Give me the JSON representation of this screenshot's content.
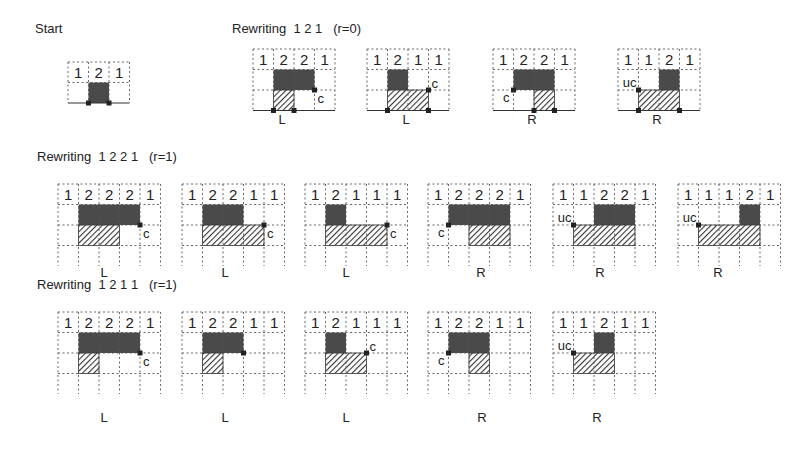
{
  "colors": {
    "solid": "#4a4a4a",
    "grid": "#555555",
    "hatch": "#333333",
    "background": "#ffffff"
  },
  "sections": [
    {
      "id": "start",
      "title": "Start",
      "title_pos": [
        35,
        35
      ]
    },
    {
      "id": "rw121",
      "title": "Rewriting  1 2 1   (r=0)",
      "title_pos": [
        232,
        35
      ]
    },
    {
      "id": "rw1221",
      "title": "Rewriting  1 2 2 1   (r=1)",
      "title_pos": [
        37,
        163
      ]
    },
    {
      "id": "rw1211",
      "title": "Rewriting  1 2 1 1   (r=1)",
      "title_pos": [
        37,
        291
      ]
    }
  ],
  "panels": [
    {
      "section": "start",
      "x": 67,
      "y": 61,
      "cell": 20.5,
      "cols": 3,
      "rows": 2,
      "heights": [
        "1",
        "2",
        "1"
      ],
      "baseline": true,
      "solid": [
        [
          1,
          1,
          1,
          1
        ]
      ],
      "hatch": [],
      "marks": [
        [
          1,
          2
        ],
        [
          2,
          2
        ]
      ],
      "annot": null,
      "label": "",
      "label_pos": null
    },
    {
      "section": "rw121",
      "x": 252,
      "y": 48,
      "cell": 20.5,
      "cols": 4,
      "rows": 3,
      "heights": [
        "1",
        "2",
        "2",
        "1"
      ],
      "baseline": true,
      "solid": [
        [
          1,
          1,
          2,
          1
        ]
      ],
      "hatch": [
        [
          1,
          2,
          1,
          1
        ]
      ],
      "marks": [
        [
          1,
          3
        ],
        [
          2,
          3
        ],
        [
          3,
          2
        ]
      ],
      "annot": {
        "text": "c",
        "at": [
          3,
          2
        ],
        "side": "br"
      },
      "label": "L",
      "label_pos": [
        282,
        120
      ]
    },
    {
      "section": "rw121",
      "x": 366,
      "y": 48,
      "cell": 20.5,
      "cols": 4,
      "rows": 3,
      "heights": [
        "1",
        "2",
        "1",
        "1"
      ],
      "baseline": true,
      "solid": [
        [
          1,
          1,
          1,
          1
        ]
      ],
      "hatch": [
        [
          1,
          2,
          2,
          1
        ]
      ],
      "marks": [
        [
          1,
          3
        ],
        [
          3,
          3
        ],
        [
          3,
          2
        ]
      ],
      "annot": {
        "text": "c",
        "at": [
          3,
          2
        ],
        "side": "tr"
      },
      "label": "L",
      "label_pos": [
        406,
        120
      ]
    },
    {
      "section": "rw121",
      "x": 492,
      "y": 48,
      "cell": 20.5,
      "cols": 4,
      "rows": 3,
      "heights": [
        "1",
        "2",
        "2",
        "1"
      ],
      "baseline": true,
      "solid": [
        [
          1,
          1,
          2,
          1
        ]
      ],
      "hatch": [
        [
          2,
          2,
          1,
          1
        ]
      ],
      "marks": [
        [
          2,
          3
        ],
        [
          3,
          3
        ],
        [
          1,
          2
        ]
      ],
      "annot": {
        "text": "c",
        "at": [
          1,
          2
        ],
        "side": "bl"
      },
      "label": "R",
      "label_pos": [
        532,
        120
      ]
    },
    {
      "section": "rw121",
      "x": 617,
      "y": 48,
      "cell": 20.5,
      "cols": 4,
      "rows": 3,
      "heights": [
        "1",
        "1",
        "2",
        "1"
      ],
      "baseline": true,
      "solid": [
        [
          2,
          1,
          1,
          1
        ]
      ],
      "hatch": [
        [
          1,
          2,
          2,
          1
        ]
      ],
      "marks": [
        [
          1,
          3
        ],
        [
          3,
          3
        ],
        [
          1,
          2
        ]
      ],
      "annot": {
        "text": "uc",
        "at": [
          1,
          2
        ],
        "side": "tl"
      },
      "label": "R",
      "label_pos": [
        657,
        120
      ]
    },
    {
      "section": "rw1221",
      "x": 57,
      "y": 183,
      "cell": 20.5,
      "cols": 5,
      "rows": 4,
      "heights": [
        "1",
        "2",
        "2",
        "2",
        "1"
      ],
      "baseline": false,
      "solid": [
        [
          1,
          1,
          3,
          1
        ]
      ],
      "hatch": [
        [
          1,
          2,
          2,
          1
        ]
      ],
      "marks": [
        [
          4,
          2
        ]
      ],
      "annot": {
        "text": "c",
        "at": [
          4,
          2
        ],
        "side": "br"
      },
      "label": "L",
      "label_pos": [
        104,
        273
      ]
    },
    {
      "section": "rw1221",
      "x": 181,
      "y": 183,
      "cell": 20.5,
      "cols": 5,
      "rows": 4,
      "heights": [
        "1",
        "2",
        "2",
        "1",
        "1"
      ],
      "baseline": false,
      "solid": [
        [
          1,
          1,
          2,
          1
        ]
      ],
      "hatch": [
        [
          1,
          2,
          3,
          1
        ]
      ],
      "marks": [
        [
          4,
          2
        ]
      ],
      "annot": {
        "text": "c",
        "at": [
          4,
          2
        ],
        "side": "br"
      },
      "label": "L",
      "label_pos": [
        225,
        273
      ]
    },
    {
      "section": "rw1221",
      "x": 304,
      "y": 183,
      "cell": 20.5,
      "cols": 5,
      "rows": 4,
      "heights": [
        "1",
        "2",
        "1",
        "1",
        "1"
      ],
      "baseline": false,
      "solid": [
        [
          1,
          1,
          1,
          1
        ]
      ],
      "hatch": [
        [
          1,
          2,
          3,
          1
        ]
      ],
      "marks": [
        [
          4,
          2
        ]
      ],
      "annot": {
        "text": "c",
        "at": [
          4,
          2
        ],
        "side": "br"
      },
      "label": "L",
      "label_pos": [
        346,
        273
      ]
    },
    {
      "section": "rw1221",
      "x": 427,
      "y": 183,
      "cell": 20.5,
      "cols": 5,
      "rows": 4,
      "heights": [
        "1",
        "2",
        "2",
        "2",
        "1"
      ],
      "baseline": false,
      "solid": [
        [
          1,
          1,
          3,
          1
        ]
      ],
      "hatch": [
        [
          2,
          2,
          2,
          1
        ]
      ],
      "marks": [
        [
          1,
          2
        ]
      ],
      "annot": {
        "text": "c",
        "at": [
          1,
          2
        ],
        "side": "bl"
      },
      "label": "R",
      "label_pos": [
        481,
        273
      ]
    },
    {
      "section": "rw1221",
      "x": 552,
      "y": 183,
      "cell": 20.5,
      "cols": 5,
      "rows": 4,
      "heights": [
        "1",
        "1",
        "2",
        "2",
        "1"
      ],
      "baseline": false,
      "solid": [
        [
          2,
          1,
          2,
          1
        ]
      ],
      "hatch": [
        [
          1,
          2,
          3,
          1
        ]
      ],
      "marks": [
        [
          1,
          2
        ]
      ],
      "annot": {
        "text": "uc",
        "at": [
          1,
          2
        ],
        "side": "tl"
      },
      "label": "R",
      "label_pos": [
        600,
        273
      ]
    },
    {
      "section": "rw1221",
      "x": 677,
      "y": 183,
      "cell": 20.5,
      "cols": 5,
      "rows": 4,
      "heights": [
        "1",
        "1",
        "1",
        "2",
        "1"
      ],
      "baseline": false,
      "solid": [
        [
          3,
          1,
          1,
          1
        ]
      ],
      "hatch": [
        [
          1,
          2,
          3,
          1
        ]
      ],
      "marks": [
        [
          1,
          2
        ]
      ],
      "annot": {
        "text": "uc",
        "at": [
          1,
          2
        ],
        "side": "tl"
      },
      "label": "R",
      "label_pos": [
        718,
        273
      ]
    },
    {
      "section": "rw1211",
      "x": 57,
      "y": 311,
      "cell": 20.5,
      "cols": 5,
      "rows": 4,
      "heights": [
        "1",
        "2",
        "2",
        "2",
        "1"
      ],
      "baseline": false,
      "solid": [
        [
          1,
          1,
          3,
          1
        ]
      ],
      "hatch": [
        [
          1,
          2,
          1,
          1
        ]
      ],
      "marks": [
        [
          4,
          2
        ]
      ],
      "annot": {
        "text": "c",
        "at": [
          4,
          2
        ],
        "side": "br"
      },
      "label": "L",
      "label_pos": [
        104,
        418
      ]
    },
    {
      "section": "rw1211",
      "x": 181,
      "y": 311,
      "cell": 20.5,
      "cols": 5,
      "rows": 4,
      "heights": [
        "1",
        "2",
        "2",
        "1",
        "1"
      ],
      "baseline": false,
      "solid": [
        [
          1,
          1,
          2,
          1
        ]
      ],
      "hatch": [
        [
          1,
          2,
          1,
          1
        ]
      ],
      "marks": [
        [
          3,
          2
        ]
      ],
      "annot": null,
      "label": "L",
      "label_pos": [
        225,
        418
      ]
    },
    {
      "section": "rw1211",
      "x": 304,
      "y": 311,
      "cell": 20.5,
      "cols": 5,
      "rows": 4,
      "heights": [
        "1",
        "2",
        "1",
        "1",
        "1"
      ],
      "baseline": false,
      "solid": [
        [
          1,
          1,
          1,
          1
        ]
      ],
      "hatch": [
        [
          1,
          2,
          2,
          1
        ]
      ],
      "marks": [
        [
          3,
          2
        ]
      ],
      "annot": {
        "text": "c",
        "at": [
          3,
          2
        ],
        "side": "tr"
      },
      "label": "L",
      "label_pos": [
        346,
        418
      ]
    },
    {
      "section": "rw1211",
      "x": 427,
      "y": 311,
      "cell": 20.5,
      "cols": 5,
      "rows": 4,
      "heights": [
        "1",
        "2",
        "2",
        "1",
        "1"
      ],
      "baseline": false,
      "solid": [
        [
          1,
          1,
          2,
          1
        ]
      ],
      "hatch": [
        [
          2,
          2,
          1,
          1
        ]
      ],
      "marks": [
        [
          1,
          2
        ]
      ],
      "annot": {
        "text": "c",
        "at": [
          1,
          2
        ],
        "side": "bl"
      },
      "label": "R",
      "label_pos": [
        482,
        418
      ]
    },
    {
      "section": "rw1211",
      "x": 552,
      "y": 311,
      "cell": 20.5,
      "cols": 5,
      "rows": 4,
      "heights": [
        "1",
        "1",
        "2",
        "1",
        "1"
      ],
      "baseline": false,
      "solid": [
        [
          2,
          1,
          1,
          1
        ]
      ],
      "hatch": [
        [
          1,
          2,
          2,
          1
        ]
      ],
      "marks": [
        [
          1,
          2
        ]
      ],
      "annot": {
        "text": "uc",
        "at": [
          1,
          2
        ],
        "side": "tl"
      },
      "label": "R",
      "label_pos": [
        597,
        418
      ]
    }
  ]
}
